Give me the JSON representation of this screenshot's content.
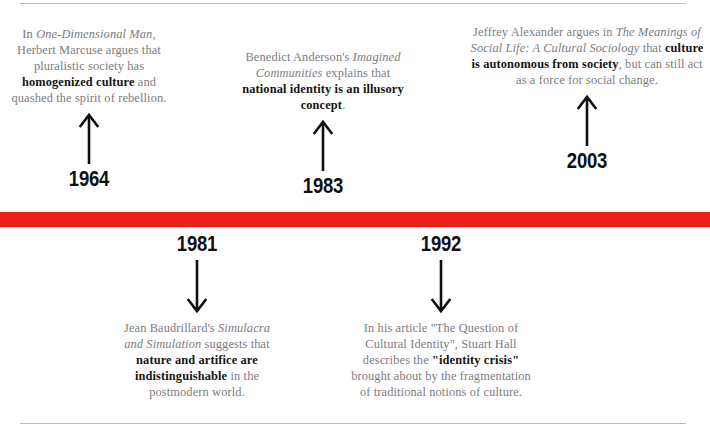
{
  "figure": {
    "type": "timeline",
    "orientation": "horizontal",
    "axis_color": "#e8201c",
    "body_text_color": "#7c7c80",
    "highlight_text_color": "#141414",
    "rule_color": "#b9b9bd"
  },
  "events": [
    {
      "year": "1964",
      "position": "above",
      "arrow": "arrow-up",
      "segments": [
        {
          "text": "In ",
          "style": "regular"
        },
        {
          "text": "One-Dimensional Man",
          "style": "italic"
        },
        {
          "text": ", Herbert Marcuse argues that pluralistic society has ",
          "style": "regular"
        },
        {
          "text": "homogenized culture",
          "style": "bold"
        },
        {
          "text": " and quashed the spirit of rebellion.",
          "style": "regular"
        }
      ]
    },
    {
      "year": "1983",
      "position": "above",
      "arrow": "arrow-up",
      "segments": [
        {
          "text": "Benedict Anderson's ",
          "style": "regular"
        },
        {
          "text": "Imagined Communities",
          "style": "italic"
        },
        {
          "text": " explains that ",
          "style": "regular"
        },
        {
          "text": "national identity is an illusory concept",
          "style": "bold"
        },
        {
          "text": ".",
          "style": "regular"
        }
      ]
    },
    {
      "year": "2003",
      "position": "above",
      "arrow": "arrow-up",
      "segments": [
        {
          "text": "Jeffrey Alexander argues in ",
          "style": "regular"
        },
        {
          "text": "The Meanings of Social Life: A Cultural Sociology",
          "style": "italic"
        },
        {
          "text": " that ",
          "style": "regular"
        },
        {
          "text": "culture is autonomous from society",
          "style": "bold"
        },
        {
          "text": ", but can still act as a force for social change.",
          "style": "regular"
        }
      ]
    },
    {
      "year": "1981",
      "position": "below",
      "arrow": "arrow-down",
      "segments": [
        {
          "text": "Jean Baudrillard's ",
          "style": "regular"
        },
        {
          "text": "Simulacra and Simulation",
          "style": "italic"
        },
        {
          "text": " suggests that ",
          "style": "regular"
        },
        {
          "text": "nature and artifice are indistinguishable",
          "style": "bold"
        },
        {
          "text": " in the postmodern world.",
          "style": "regular"
        }
      ]
    },
    {
      "year": "1992",
      "position": "below",
      "arrow": "arrow-down",
      "segments": [
        {
          "text": "In his article \"The Question of Cultural Identity\", Stuart Hall describes the ",
          "style": "regular"
        },
        {
          "text": "\"identity crisis\"",
          "style": "bold"
        },
        {
          "text": " brought about by the fragmentation of traditional notions of culture.",
          "style": "regular"
        }
      ]
    }
  ]
}
